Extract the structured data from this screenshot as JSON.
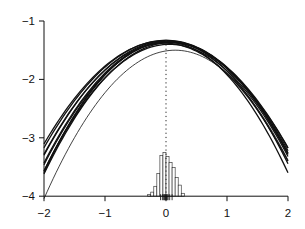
{
  "chart_data": {
    "type": "line",
    "title": "",
    "xlabel": "",
    "ylabel": "",
    "xlim": [
      -2,
      2
    ],
    "ylim": [
      -4,
      -1
    ],
    "grid": false,
    "legend": null,
    "x_ticks": [
      -2,
      -1,
      0,
      1,
      2
    ],
    "x_tick_labels": [
      "−2",
      "−1",
      "0",
      "1",
      "2"
    ],
    "y_ticks": [
      -1,
      -2,
      -3,
      -4
    ],
    "y_tick_labels": [
      "−1",
      "−2",
      "−3",
      "−4"
    ],
    "curve_form": "y = peak - width * (x - center)^2",
    "series": [
      {
        "name": "curve-1",
        "peak": -1.34,
        "width": 0.48,
        "center": 0.02,
        "y_at_minus2": -3.3,
        "y_at_plus2": -3.22
      },
      {
        "name": "curve-2",
        "peak": -1.36,
        "width": 0.5,
        "center": 0.05,
        "y_at_minus2": -3.46,
        "y_at_plus2": -3.26
      },
      {
        "name": "curve-3",
        "peak": -1.33,
        "width": 0.46,
        "center": 0.0,
        "y_at_minus2": -3.17,
        "y_at_plus2": -3.17
      },
      {
        "name": "curve-4",
        "peak": -1.37,
        "width": 0.52,
        "center": 0.08,
        "y_at_minus2": -3.62,
        "y_at_plus2": -3.29
      },
      {
        "name": "curve-5",
        "peak": -1.35,
        "width": 0.54,
        "center": 0.03,
        "y_at_minus2": -3.58,
        "y_at_plus2": -3.45
      },
      {
        "name": "curve-6",
        "peak": -1.38,
        "width": 0.49,
        "center": -0.03,
        "y_at_minus2": -3.28,
        "y_at_plus2": -3.4
      },
      {
        "name": "curve-7",
        "peak": -1.36,
        "width": 0.56,
        "center": 0.0,
        "y_at_minus2": -3.6,
        "y_at_plus2": -3.6
      },
      {
        "name": "curve-8",
        "peak": -1.34,
        "width": 0.45,
        "center": -0.02,
        "y_at_minus2": -3.1,
        "y_at_plus2": -3.16
      },
      {
        "name": "curve-9",
        "peak": -1.4,
        "width": 0.51,
        "center": 0.06,
        "y_at_minus2": -3.56,
        "y_at_plus2": -3.32
      },
      {
        "name": "curve-10",
        "peak": -1.35,
        "width": 0.5,
        "center": 0.04,
        "y_at_minus2": -3.45,
        "y_at_plus2": -3.28
      },
      {
        "name": "curve-outlier",
        "peak": -1.5,
        "width": 0.55,
        "center": 0.15,
        "y_at_minus2": -4.04,
        "y_at_plus2": -3.38,
        "thin": true
      }
    ],
    "reference_line": {
      "x": 0,
      "style": "dotted",
      "from_y": -4,
      "to_y": -1.33
    },
    "histogram": {
      "baseline": -4,
      "bin_start": -0.3,
      "bin_width": 0.05,
      "heights": [
        0.03,
        0.07,
        0.17,
        0.39,
        0.7,
        0.75,
        0.68,
        0.58,
        0.49,
        0.32,
        0.19,
        0.05
      ]
    },
    "rug": [
      -0.09,
      -0.06,
      -0.045,
      -0.03,
      -0.02,
      -0.01,
      0.0,
      0.01,
      0.02,
      0.035,
      0.06,
      0.1
    ]
  },
  "colors": {
    "background": "#ffffff",
    "ink": "#111111"
  }
}
